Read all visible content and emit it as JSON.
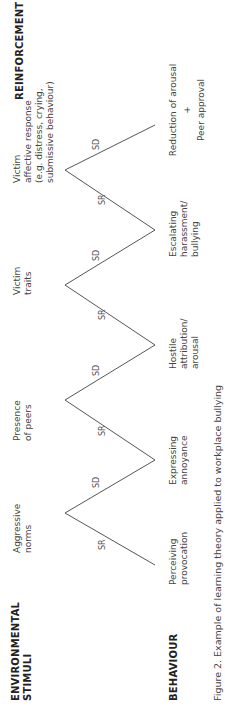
{
  "headers": {
    "stimuli": "ENVIRONMENTAL",
    "stimuli_line2": "STIMULI",
    "behaviour": "BEHAVIOUR",
    "reinforcement": "REINFORCEMENT"
  },
  "stimuli": [
    {
      "line1": "Aggressive",
      "line2": "norms"
    },
    {
      "line1": "Presence",
      "line2": "of peers"
    },
    {
      "line1": "Victim",
      "line2": "traits"
    },
    {
      "line1": "Victim",
      "line2": "affective response",
      "line3": "(e.g. distress, crying,",
      "line4": "submissive behaviour)"
    }
  ],
  "behaviours": [
    {
      "line1": "Perceiving",
      "line2": "provocation"
    },
    {
      "line1": "Expressing",
      "line2": "annoyance"
    },
    {
      "line1": "Hostile",
      "line2": "attribution/",
      "line3": "arousal"
    },
    {
      "line1": "Escalating",
      "line2": "harassment/",
      "line3": "bullying"
    },
    {
      "line1": "Reduction of arousal",
      "line2": "+",
      "line3": "Peer approval"
    }
  ],
  "edge_labels": {
    "sr": "SR",
    "sd": "SD"
  },
  "caption": "Figure 2. Example of learning theory applied to workplace bullying"
}
